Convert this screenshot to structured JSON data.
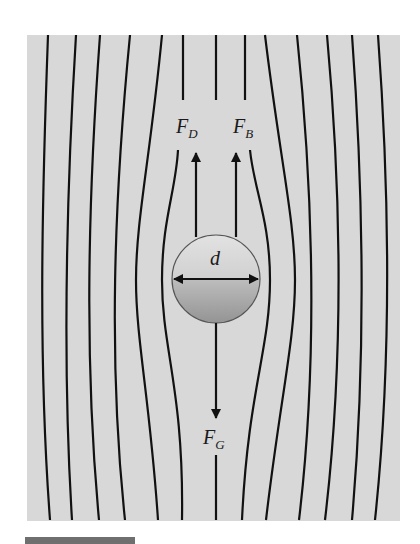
{
  "figure": {
    "type": "free-body diagram of sphere in fluid flow",
    "colors": {
      "background": "#d8d8d8",
      "streamline": "#111111",
      "sphere_top": "#dcdcdc",
      "sphere_bottom": "#9a9a9a",
      "footer_bar": "#6f6f6f"
    },
    "labels": {
      "drag_force": {
        "main": "F",
        "sub": "D"
      },
      "buoyant_force": {
        "main": "F",
        "sub": "B"
      },
      "gravity_force": {
        "main": "F",
        "sub": "G"
      },
      "diameter": "d"
    }
  }
}
